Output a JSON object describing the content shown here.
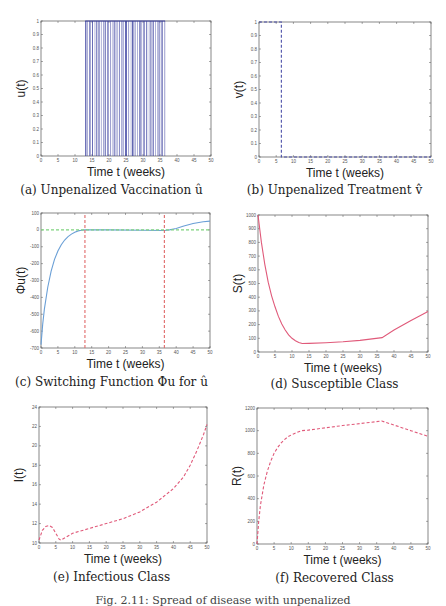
{
  "figure": {
    "caption_fragment": "Fig. 2.11: Spread of disease with unpenalized"
  },
  "colors": {
    "vaccination_blue": "#3a3f9e",
    "treatment_blue": "#4a4fa8",
    "switching_blue": "#6a9fd6",
    "zero_line_green": "#7fd47f",
    "switch_red": "#e06a6a",
    "class_pink": "#e05a7a",
    "axis": "#555555"
  },
  "chart_data": [
    {
      "id": "a",
      "type": "bar",
      "caption": "(a) Unpenalized Vaccination û",
      "xlabel": "Time t (weeks)",
      "ylabel": "u(t)",
      "xlim": [
        0,
        50
      ],
      "ylim": [
        0,
        1
      ],
      "xticks": [
        0,
        5,
        10,
        15,
        20,
        25,
        30,
        35,
        40,
        45,
        50
      ],
      "yticks": [
        0,
        0.1,
        0.2,
        0.3,
        0.4,
        0.5,
        0.6,
        0.7,
        0.8,
        0.9,
        1
      ],
      "ytick_labels": [
        "0",
        "0.1",
        "0.2",
        "0.3",
        "0.4",
        "0.5",
        "0.6",
        "0.7",
        "0.8",
        "0.9",
        "1"
      ],
      "active_interval": [
        13,
        36.5
      ],
      "description": "Bang-bang vaccination control switching between 0 and 1; individual switch times not legible"
    },
    {
      "id": "b",
      "type": "line",
      "caption": "(b) Unpenalized Treatment v̂",
      "xlabel": "Time t (weeks)",
      "ylabel": "v(t)",
      "xlim": [
        0,
        50
      ],
      "ylim": [
        0,
        1
      ],
      "xticks": [
        0,
        5,
        10,
        15,
        20,
        25,
        30,
        35,
        40,
        45,
        50
      ],
      "yticks": [
        0,
        0.1,
        0.2,
        0.3,
        0.4,
        0.5,
        0.6,
        0.7,
        0.8,
        0.9,
        1
      ],
      "ytick_labels": [
        "0",
        "0.1",
        "0.2",
        "0.3",
        "0.4",
        "0.5",
        "0.6",
        "0.7",
        "0.8",
        "0.9",
        "1"
      ],
      "series": [
        {
          "name": "v(t)",
          "style": "dashed",
          "x": [
            0,
            6.5,
            6.5,
            50
          ],
          "y": [
            1,
            1,
            0,
            0
          ]
        }
      ]
    },
    {
      "id": "c",
      "type": "line",
      "caption": "(c) Switching Function Φu for û",
      "xlabel": "Time t (weeks)",
      "ylabel": "Φu(t)",
      "xlim": [
        0,
        50
      ],
      "ylim": [
        -700,
        100
      ],
      "xticks": [
        0,
        5,
        10,
        15,
        20,
        25,
        30,
        35,
        40,
        45,
        50
      ],
      "yticks": [
        -700,
        -600,
        -500,
        -400,
        -300,
        -200,
        -100,
        0,
        100
      ],
      "ytick_labels": [
        "-700",
        "-600",
        "-500",
        "-400",
        "-300",
        "-200",
        "-100",
        "0",
        "100"
      ],
      "series": [
        {
          "name": "Φu(t)",
          "style": "solid",
          "x": [
            0,
            0.5,
            1,
            2,
            3,
            4,
            5,
            6,
            7,
            8,
            9,
            10,
            11,
            12,
            13,
            20,
            30,
            36.5,
            38,
            40,
            42,
            45,
            48,
            50
          ],
          "y": [
            -680,
            -560,
            -470,
            -340,
            -245,
            -175,
            -125,
            -88,
            -60,
            -40,
            -25,
            -14,
            -6,
            -2,
            0,
            0,
            -2,
            -4,
            0,
            8,
            22,
            38,
            48,
            52
          ]
        },
        {
          "name": "zero line",
          "style": "dashed",
          "x": [
            0,
            50
          ],
          "y": [
            0,
            0
          ]
        },
        {
          "name": "switch start",
          "style": "dashed",
          "x": [
            13,
            13
          ],
          "y": [
            -700,
            100
          ]
        },
        {
          "name": "switch end",
          "style": "dashed",
          "x": [
            36.5,
            36.5
          ],
          "y": [
            -700,
            100
          ]
        }
      ]
    },
    {
      "id": "d",
      "type": "line",
      "caption": "(d) Susceptible Class",
      "xlabel": "Time t (weeks)",
      "ylabel": "S(t)",
      "xlim": [
        0,
        50
      ],
      "ylim": [
        0,
        1000
      ],
      "xticks": [
        0,
        5,
        10,
        15,
        20,
        25,
        30,
        35,
        40,
        45,
        50
      ],
      "yticks": [
        0,
        100,
        200,
        300,
        400,
        500,
        600,
        700,
        800,
        900,
        1000
      ],
      "ytick_labels": [
        "0",
        "100",
        "200",
        "300",
        "400",
        "500",
        "600",
        "700",
        "800",
        "900",
        "1000"
      ],
      "series": [
        {
          "name": "S(t)",
          "style": "solid",
          "x": [
            0,
            1,
            2,
            3,
            4,
            5,
            6,
            7,
            8,
            9,
            10,
            11,
            12,
            13,
            15,
            20,
            25,
            30,
            36.5,
            40,
            45,
            50
          ],
          "y": [
            1000,
            800,
            640,
            510,
            410,
            330,
            260,
            205,
            160,
            125,
            100,
            82,
            70,
            62,
            63,
            68,
            75,
            85,
            105,
            160,
            230,
            295
          ]
        }
      ]
    },
    {
      "id": "e",
      "type": "line",
      "caption": "(e) Infectious Class",
      "xlabel": "Time t (weeks)",
      "ylabel": "I(t)",
      "xlim": [
        0,
        50
      ],
      "ylim": [
        10,
        24
      ],
      "xticks": [
        0,
        5,
        10,
        15,
        20,
        25,
        30,
        35,
        40,
        45,
        50
      ],
      "yticks": [
        10,
        12,
        14,
        16,
        18,
        20,
        22,
        24
      ],
      "ytick_labels": [
        "10",
        "12",
        "14",
        "16",
        "18",
        "20",
        "22",
        "24"
      ],
      "series": [
        {
          "name": "I(t)",
          "style": "dashed",
          "x": [
            0,
            1,
            2,
            3,
            4,
            5,
            6,
            6.5,
            8,
            10,
            15,
            20,
            25,
            30,
            35,
            40,
            43,
            45,
            47,
            49,
            50
          ],
          "y": [
            10.3,
            11.3,
            11.7,
            11.8,
            11.6,
            11.0,
            10.4,
            10.3,
            10.6,
            11.0,
            11.5,
            12.0,
            12.5,
            13.2,
            14.2,
            15.6,
            16.8,
            18.0,
            19.5,
            21.2,
            22.2
          ]
        }
      ]
    },
    {
      "id": "f",
      "type": "line",
      "caption": "(f) Recovered Class",
      "xlabel": "Time t (weeks)",
      "ylabel": "R(t)",
      "xlim": [
        0,
        50
      ],
      "ylim": [
        0,
        1200
      ],
      "xticks": [
        0,
        5,
        10,
        15,
        20,
        25,
        30,
        35,
        40,
        45,
        50
      ],
      "yticks": [
        0,
        200,
        400,
        600,
        800,
        1000,
        1200
      ],
      "ytick_labels": [
        "0",
        "200",
        "400",
        "600",
        "800",
        "1000",
        "1200"
      ],
      "series": [
        {
          "name": "R(t)",
          "style": "dashed",
          "x": [
            0,
            0.5,
            1,
            2,
            3,
            4,
            5,
            6,
            7,
            8,
            9,
            10,
            11,
            12,
            13,
            15,
            20,
            25,
            30,
            36.5,
            40,
            45,
            50
          ],
          "y": [
            0,
            200,
            340,
            520,
            640,
            730,
            800,
            850,
            890,
            920,
            945,
            962,
            975,
            988,
            1000,
            1005,
            1025,
            1045,
            1062,
            1085,
            1050,
            1000,
            950
          ]
        }
      ]
    }
  ]
}
